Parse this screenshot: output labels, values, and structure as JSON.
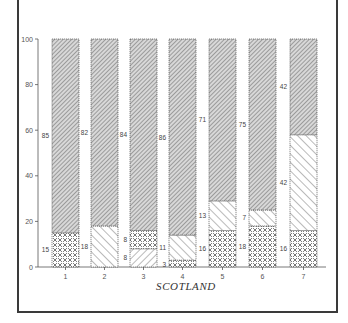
{
  "chart_data": {
    "type": "bar",
    "stacked": true,
    "percent": true,
    "title": "",
    "xlabel": "SCOTLAND",
    "ylabel": "",
    "ylim": [
      0,
      100
    ],
    "yticks": [
      0,
      20,
      40,
      60,
      80,
      100
    ],
    "categories": [
      "1",
      "2",
      "3",
      "4",
      "5",
      "6",
      "7"
    ],
    "grid": false,
    "legend": null,
    "bars": [
      {
        "category": "1",
        "segments": [
          {
            "pattern": "crosshatch",
            "value": 15
          },
          {
            "pattern": "dense-gray",
            "value": 85
          }
        ]
      },
      {
        "category": "2",
        "segments": [
          {
            "pattern": "forward-diagonal",
            "value": 18
          },
          {
            "pattern": "dense-gray",
            "value": 82
          }
        ]
      },
      {
        "category": "3",
        "segments": [
          {
            "pattern": "back-diagonal",
            "value": 8
          },
          {
            "pattern": "crosshatch",
            "value": 8
          },
          {
            "pattern": "dense-gray",
            "value": 84
          }
        ]
      },
      {
        "category": "4",
        "segments": [
          {
            "pattern": "crosshatch",
            "value": 3
          },
          {
            "pattern": "forward-diagonal",
            "value": 11
          },
          {
            "pattern": "dense-gray",
            "value": 86
          }
        ]
      },
      {
        "category": "5",
        "segments": [
          {
            "pattern": "crosshatch",
            "value": 16
          },
          {
            "pattern": "forward-diagonal",
            "value": 13
          },
          {
            "pattern": "dense-gray",
            "value": 71
          }
        ]
      },
      {
        "category": "6",
        "segments": [
          {
            "pattern": "crosshatch",
            "value": 18
          },
          {
            "pattern": "forward-diagonal",
            "value": 7
          },
          {
            "pattern": "dense-gray",
            "value": 75
          }
        ]
      },
      {
        "category": "7",
        "segments": [
          {
            "pattern": "crosshatch",
            "value": 16
          },
          {
            "pattern": "forward-diagonal",
            "value": 42
          },
          {
            "pattern": "dense-gray",
            "value": 42
          }
        ]
      }
    ],
    "series": [
      {
        "name": "crosshatch",
        "values": [
          15,
          0,
          8,
          3,
          16,
          18,
          16
        ]
      },
      {
        "name": "forward-diagonal",
        "values": [
          0,
          18,
          0,
          11,
          13,
          7,
          42
        ]
      },
      {
        "name": "back-diagonal",
        "values": [
          0,
          0,
          8,
          0,
          0,
          0,
          0
        ]
      },
      {
        "name": "dense-gray",
        "values": [
          85,
          82,
          84,
          86,
          71,
          75,
          42
        ]
      }
    ]
  },
  "colors": {
    "frame": "#3a3a3a",
    "axis": "#555555",
    "bar_outline": "#555555",
    "dense_gray": "#9a9a9a"
  }
}
